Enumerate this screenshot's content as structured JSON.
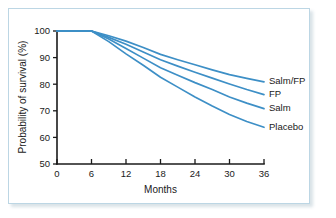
{
  "chart_data": {
    "type": "line",
    "title": "",
    "xlabel": "Months",
    "ylabel": "Probability of survival (%)",
    "xlim": [
      0,
      36
    ],
    "ylim": [
      50,
      100
    ],
    "xticks": [
      0,
      6,
      12,
      18,
      24,
      30,
      36
    ],
    "yticks": [
      50,
      60,
      70,
      80,
      90,
      100
    ],
    "grid": false,
    "legend_position": "right-inline-end-of-line",
    "line_color": "#3d8fc6",
    "axis_color": "#1a1a1a",
    "frame_color": "#bcd6e4",
    "x": [
      0,
      6,
      9,
      12,
      15,
      18,
      21,
      24,
      27,
      30,
      33,
      36
    ],
    "series": [
      {
        "name": "Salm/FP",
        "label": "Salm/FP",
        "values": [
          100,
          100,
          98.2,
          96.2,
          93.8,
          91.2,
          89.2,
          87.3,
          85.4,
          83.6,
          82.2,
          80.9
        ]
      },
      {
        "name": "FP",
        "label": "FP",
        "values": [
          100,
          100,
          97.6,
          95.0,
          92.1,
          89.2,
          86.8,
          84.5,
          82.3,
          80.1,
          78.0,
          76.1
        ]
      },
      {
        "name": "Salm",
        "label": "Salm",
        "values": [
          100,
          100,
          97.0,
          93.4,
          89.8,
          86.2,
          83.4,
          80.6,
          78.0,
          75.2,
          72.9,
          70.8
        ]
      },
      {
        "name": "Placebo",
        "label": "Placebo",
        "values": [
          100,
          100,
          96.0,
          91.4,
          87.1,
          82.6,
          78.9,
          75.2,
          71.8,
          68.6,
          66.0,
          63.8
        ]
      }
    ]
  }
}
